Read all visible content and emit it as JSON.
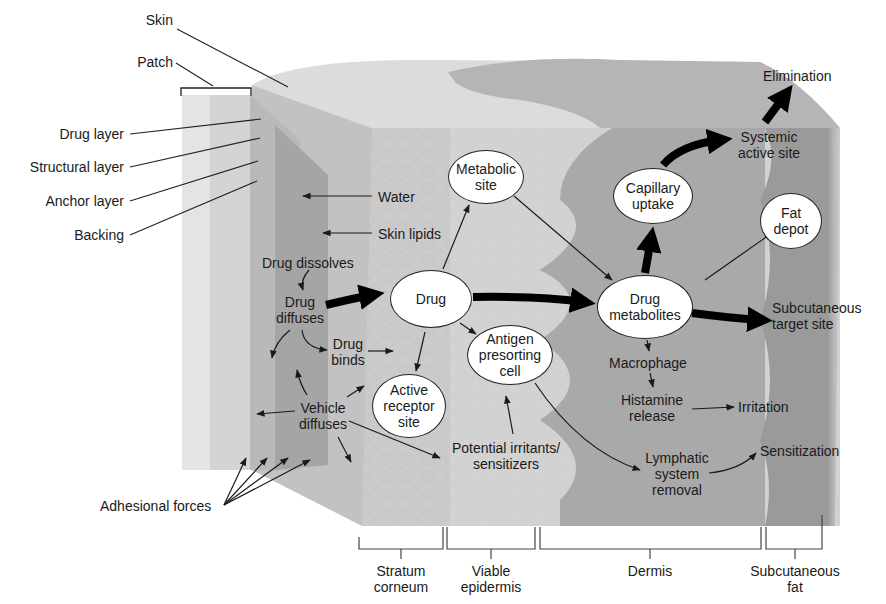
{
  "diagram": {
    "left_labels": {
      "skin": "Skin",
      "patch": "Patch",
      "drug_layer": "Drug layer",
      "structural_layer": "Structural layer",
      "anchor_layer": "Anchor layer",
      "backing": "Backing",
      "adhesional_forces": "Adhesional forces"
    },
    "inline_labels": {
      "water": "Water",
      "skin_lipids": "Skin lipids",
      "drug_dissolves": "Drug dissolves",
      "drug_diffuses_1": "Drug",
      "drug_diffuses_2": "diffuses",
      "drug_binds_1": "Drug",
      "drug_binds_2": "binds",
      "vehicle_diffuses_1": "Vehicle",
      "vehicle_diffuses_2": "diffuses",
      "potential_irritants_1": "Potential irritants/",
      "potential_irritants_2": "sensitizers",
      "macrophage": "Macrophage",
      "histamine_1": "Histamine",
      "histamine_2": "release",
      "irritation": "Irritation",
      "lymphatic_1": "Lymphatic",
      "lymphatic_2": "system",
      "lymphatic_3": "removal",
      "sensitization": "Sensitization",
      "elimination": "Elimination",
      "systemic_1": "Systemic",
      "systemic_2": "active site",
      "subcutaneous_target_1": "Subcutaneous",
      "subcutaneous_target_2": "target site"
    },
    "nodes": {
      "metabolic_site_1": "Metabolic",
      "metabolic_site_2": "site",
      "drug": "Drug",
      "antigen_1": "Antigen",
      "antigen_2": "presorting",
      "antigen_3": "cell",
      "active_receptor_1": "Active",
      "active_receptor_2": "receptor",
      "active_receptor_3": "site",
      "capillary_1": "Capillary",
      "capillary_2": "uptake",
      "fat_depot_1": "Fat",
      "fat_depot_2": "depot",
      "drug_metabolites_1": "Drug",
      "drug_metabolites_2": "metabolites"
    },
    "layers": [
      {
        "line1": "Stratum",
        "line2": "corneum"
      },
      {
        "line1": "Viable",
        "line2": "epidermis"
      },
      {
        "line1": "Dermis",
        "line2": ""
      },
      {
        "line1": "Subcutaneous",
        "line2": "fat"
      }
    ]
  }
}
